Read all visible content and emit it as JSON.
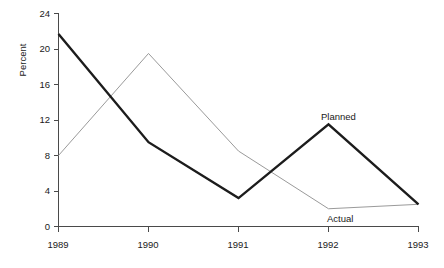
{
  "chart_data": {
    "type": "line",
    "title": "",
    "subtitle": "",
    "xlabel": "",
    "ylabel": "Percent",
    "categories": [
      "1989",
      "1990",
      "1991",
      "1992",
      "1993"
    ],
    "x": [
      1989,
      1990,
      1991,
      1992,
      1993
    ],
    "series": [
      {
        "name": "Planned",
        "values": [
          21.7,
          9.5,
          3.2,
          11.5,
          2.5
        ],
        "color": "#1c1c1c",
        "line_width": "thick",
        "label_position": "above-1992-peak"
      },
      {
        "name": "Actual",
        "values": [
          8.0,
          19.5,
          8.5,
          2.0,
          2.5
        ],
        "color": "#9a9a9a",
        "line_width": "thin",
        "label_position": "below-1992-trough"
      }
    ],
    "xlim": [
      1989,
      1993
    ],
    "ylim": [
      0,
      24
    ],
    "yticks": [
      0,
      4,
      8,
      12,
      16,
      20,
      24
    ],
    "ytick_labels": [
      "0",
      "4",
      "8",
      "12",
      "16",
      "20",
      "24"
    ],
    "xticks": [
      1989,
      1990,
      1991,
      1992,
      1993
    ],
    "xtick_labels": [
      "1989",
      "1990",
      "1991",
      "1992",
      "1993"
    ],
    "grid": false,
    "legend": "inline-annotations",
    "legend_position": "none",
    "annotations": [
      {
        "text": "Planned",
        "series": "Planned",
        "at_x": 1992
      },
      {
        "text": "Actual",
        "series": "Actual",
        "at_x": 1992
      }
    ]
  },
  "axes": {
    "y_axis_title": "Percent",
    "y_tick_labels": [
      "24",
      "20",
      "16",
      "12",
      "8",
      "4",
      "0"
    ],
    "x_tick_labels": [
      "1989",
      "1990",
      "1991",
      "1992",
      "1993"
    ]
  },
  "labels": {
    "planned": "Planned",
    "actual": "Actual"
  },
  "colors": {
    "planned_line": "#1c1c1c",
    "actual_line": "#9a9a9a",
    "axis": "#4a4a4a",
    "text": "#1a1a1a",
    "background": "#ffffff"
  }
}
